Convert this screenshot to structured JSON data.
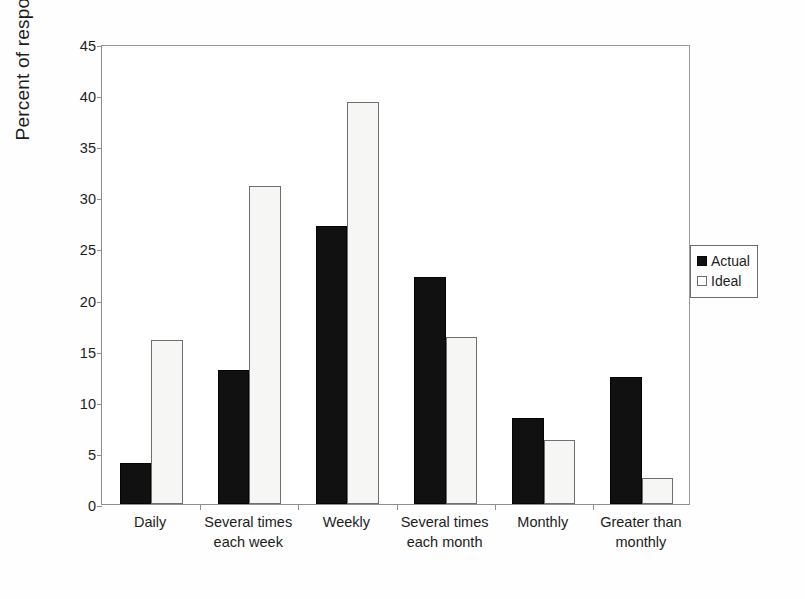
{
  "chart_data": {
    "type": "bar",
    "title": "",
    "xlabel": "",
    "ylabel": "Percent of respondents",
    "ylim": [
      0,
      45
    ],
    "ytick_step": 5,
    "yticks": [
      "0",
      "5",
      "10",
      "15",
      "20",
      "25",
      "30",
      "35",
      "40",
      "45"
    ],
    "grid": false,
    "legend_position": "right",
    "categories": [
      "Daily",
      "Several times each week",
      "Weekly",
      "Several times each month",
      "Monthly",
      "Greater than monthly"
    ],
    "category_lines": [
      [
        "Daily",
        ""
      ],
      [
        "Several times",
        "each week"
      ],
      [
        "Weekly",
        ""
      ],
      [
        "Several times",
        "each month"
      ],
      [
        "Monthly",
        ""
      ],
      [
        "Greater than",
        "monthly"
      ]
    ],
    "series": [
      {
        "name": "Actual",
        "color": "#111111",
        "values": [
          4.0,
          13.1,
          27.2,
          22.2,
          8.4,
          12.4
        ]
      },
      {
        "name": "Ideal",
        "color": "#f6f6f4",
        "values": [
          16.0,
          31.1,
          39.3,
          16.3,
          6.3,
          2.5
        ]
      }
    ]
  },
  "legend": {
    "entries": [
      {
        "label": "Actual",
        "swatch": "filled-square-icon"
      },
      {
        "label": "Ideal",
        "swatch": "outlined-square-icon"
      }
    ]
  },
  "axis": {
    "y_title": "Percent of respondents"
  }
}
